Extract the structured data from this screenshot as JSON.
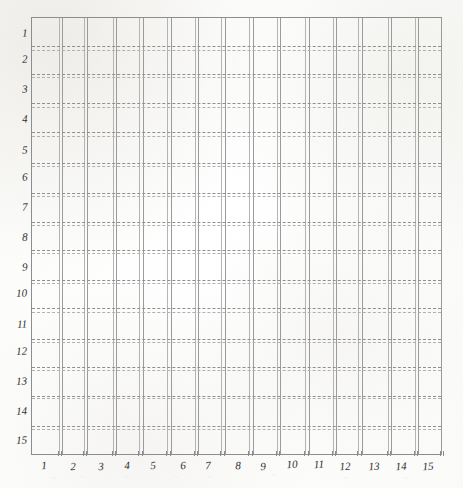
{
  "figure": {
    "kind": "hand-drawn-grid-chart",
    "background_color": "#fdfdfc",
    "frame_color": "#8d8d8d",
    "vertical_line_color": "#9b9b9b",
    "horizontal_line_color": "#8f8f8f",
    "label_color": "#2e2e2e"
  },
  "chart_data": {
    "type": "line",
    "title": "",
    "subtitle": "",
    "xlabel": "",
    "ylabel": "",
    "grid": true,
    "legend": null,
    "legend_position": "none",
    "annotations": [],
    "x_axis": {
      "position": "bottom",
      "orientation": "left-to-right",
      "min": 1,
      "max": 15,
      "tick_labels": [
        "1",
        "2",
        "3",
        "4",
        "5",
        "6",
        "7",
        "8",
        "9",
        "10",
        "11",
        "12",
        "13",
        "14",
        "15"
      ],
      "tick_values": [
        1,
        2,
        3,
        4,
        5,
        6,
        7,
        8,
        9,
        10,
        11,
        12,
        13,
        14,
        15
      ],
      "line_style": "solid-pair",
      "pair_count": 15
    },
    "y_axis": {
      "position": "left",
      "orientation": "top-to-bottom",
      "min": 1,
      "max": 15,
      "tick_labels": [
        "1",
        "2",
        "3",
        "4",
        "5",
        "6",
        "7",
        "8",
        "9",
        "10",
        "11",
        "12",
        "13",
        "14",
        "15"
      ],
      "tick_values": [
        1,
        2,
        3,
        4,
        5,
        6,
        7,
        8,
        9,
        10,
        11,
        12,
        13,
        14,
        15
      ],
      "line_style": "dashed-pair",
      "pair_count": 14
    },
    "series": [],
    "values": [],
    "categories": []
  },
  "ghost_marks": [
    {
      "text": "~",
      "x": 52
    },
    {
      "text": "~",
      "x": 80
    },
    {
      "text": "~",
      "x": 124
    },
    {
      "text": "~",
      "x": 174
    },
    {
      "text": "~",
      "x": 208
    },
    {
      "text": "~",
      "x": 272
    },
    {
      "text": "~",
      "x": 344
    },
    {
      "text": "~",
      "x": 404
    }
  ]
}
